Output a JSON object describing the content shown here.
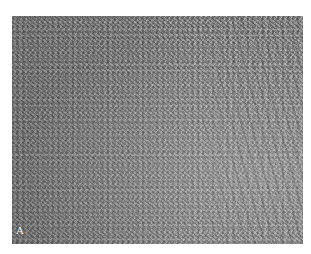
{
  "figure": {
    "type": "grayscale histology micrograph",
    "panel_label": "A",
    "colors": {
      "background": "#ffffff",
      "tissue_base": "#8c8c8c",
      "label": "#ffffff"
    }
  }
}
